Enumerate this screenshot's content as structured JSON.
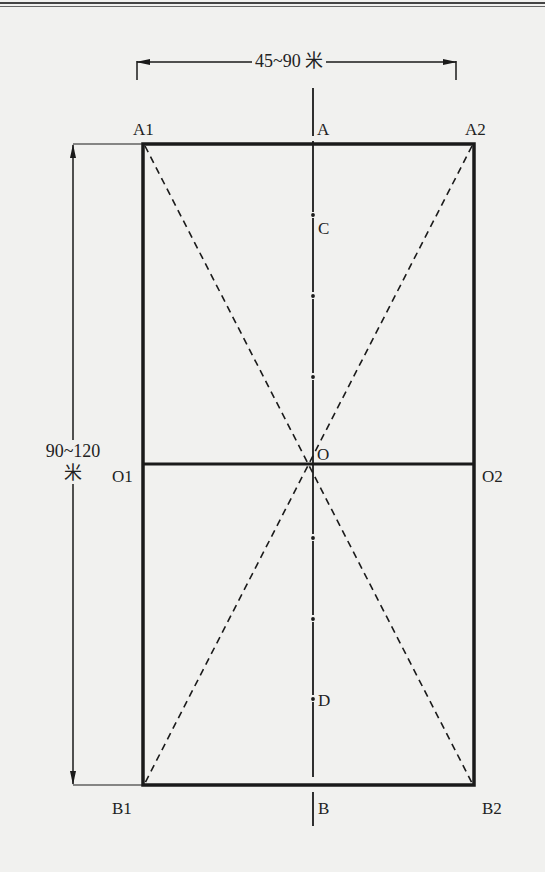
{
  "diagram": {
    "type": "field-layout-schematic",
    "dimensions": {
      "width_label": "45~90 米",
      "height_label_line1": "90~120",
      "height_label_line2": "米"
    },
    "points": {
      "A1": "A1",
      "A": "A",
      "A2": "A2",
      "C": "C",
      "O1": "O1",
      "O": "O",
      "O2": "O2",
      "D": "D",
      "B1": "B1",
      "B": "B",
      "B2": "B2"
    },
    "colors": {
      "background": "#f1f1ef",
      "line": "#1a1a1a"
    }
  }
}
